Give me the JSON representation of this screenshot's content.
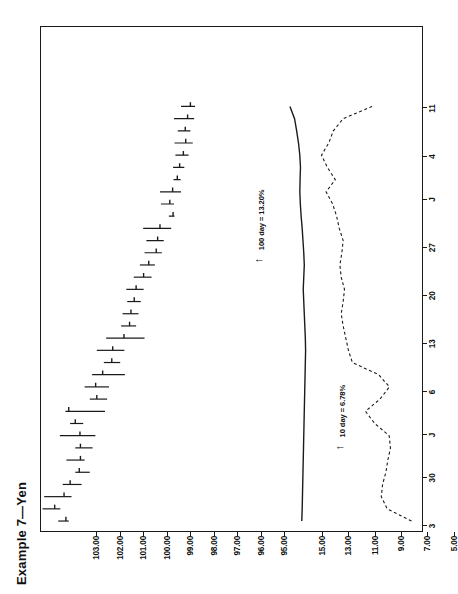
{
  "figure": {
    "title": "Example 7—Yen",
    "frame_color": "#1a1a1a"
  },
  "annotations": [
    {
      "name": "annotation-100day",
      "text": "100 day = 13.20%",
      "x": 0.555,
      "y": 0.565
    },
    {
      "name": "annotation-10day",
      "text": "10 day = 6.78%",
      "x": 0.185,
      "y": 0.775
    }
  ],
  "chart_data": {
    "type": "bar",
    "title": "Example 7—Yen",
    "xlabel": "",
    "ylabel": "",
    "grid": false,
    "legend": "none",
    "orientation": "rotated-90-ccw",
    "price_axis": {
      "name": "price-axis",
      "ticks": [
        "103.00",
        "102.00",
        "101.00",
        "100.00",
        "99.00",
        "98.00",
        "97.00",
        "96.00",
        "95.00"
      ],
      "values": [
        103.0,
        102.0,
        101.0,
        100.0,
        99.0,
        98.0,
        97.0,
        96.0,
        95.0
      ],
      "range": [
        94.4,
        103.6
      ]
    },
    "volatility_axis": {
      "name": "volatility-axis",
      "ticks": [
        "15.00",
        "13.00",
        "11.00",
        "9.00",
        "7.00",
        "5.00"
      ],
      "values": [
        15.0,
        13.0,
        11.0,
        9.0,
        7.0,
        5.0
      ],
      "range": [
        4.3,
        15.9
      ]
    },
    "date_axis": {
      "name": "date-axis",
      "ticks": [
        "3",
        "30",
        "J",
        "6",
        "13",
        "20",
        "27",
        "J",
        "4",
        "11"
      ],
      "positions": [
        0.012,
        0.107,
        0.192,
        0.277,
        0.372,
        0.467,
        0.562,
        0.657,
        0.742,
        0.837
      ]
    },
    "series": [
      {
        "name": "price-bars",
        "label": "Daily high/low/close bars",
        "style": "hlc-bar",
        "points": [
          {
            "i": 0,
            "high": 102.95,
            "low": 102.5,
            "close": 102.62
          },
          {
            "i": 1,
            "high": 103.62,
            "low": 102.86,
            "close": 103.1
          },
          {
            "i": 2,
            "high": 103.55,
            "low": 102.38,
            "close": 102.7
          },
          {
            "i": 3,
            "high": 102.76,
            "low": 101.95,
            "close": 102.44
          },
          {
            "i": 4,
            "high": 102.22,
            "low": 101.6,
            "close": 102.05
          },
          {
            "i": 5,
            "high": 102.6,
            "low": 101.82,
            "close": 102.0
          },
          {
            "i": 6,
            "high": 102.22,
            "low": 101.48,
            "close": 102.0
          },
          {
            "i": 7,
            "high": 102.88,
            "low": 101.36,
            "close": 102.02
          },
          {
            "i": 8,
            "high": 102.44,
            "low": 101.88,
            "close": 102.22
          },
          {
            "i": 9,
            "high": 102.64,
            "low": 100.95,
            "close": 102.5
          },
          {
            "i": 10,
            "high": 101.6,
            "low": 100.86,
            "close": 101.3
          },
          {
            "i": 11,
            "high": 101.82,
            "low": 100.78,
            "close": 101.35
          },
          {
            "i": 12,
            "high": 101.5,
            "low": 100.1,
            "close": 101.05
          },
          {
            "i": 13,
            "high": 101.0,
            "low": 100.3,
            "close": 100.66
          },
          {
            "i": 14,
            "high": 101.3,
            "low": 100.12,
            "close": 100.62
          },
          {
            "i": 15,
            "high": 100.9,
            "low": 99.26,
            "close": 100.14
          },
          {
            "i": 16,
            "high": 100.26,
            "low": 99.62,
            "close": 99.9
          },
          {
            "i": 17,
            "high": 100.2,
            "low": 99.52,
            "close": 99.84
          },
          {
            "i": 18,
            "high": 100.0,
            "low": 99.42,
            "close": 99.7
          },
          {
            "i": 19,
            "high": 100.04,
            "low": 99.3,
            "close": 99.62
          },
          {
            "i": 20,
            "high": 99.72,
            "low": 98.96,
            "close": 99.3
          },
          {
            "i": 21,
            "high": 99.46,
            "low": 98.82,
            "close": 99.08
          },
          {
            "i": 22,
            "high": 99.26,
            "low": 98.52,
            "close": 98.76
          },
          {
            "i": 23,
            "high": 99.18,
            "low": 98.44,
            "close": 98.7
          },
          {
            "i": 24,
            "high": 99.32,
            "low": 98.12,
            "close": 98.6
          },
          {
            "i": 25,
            "high": 98.22,
            "low": 97.98,
            "close": 98.04
          },
          {
            "i": 26,
            "high": 98.56,
            "low": 98.0,
            "close": 98.18
          },
          {
            "i": 27,
            "high": 98.6,
            "low": 97.7,
            "close": 98.06
          },
          {
            "i": 28,
            "high": 98.02,
            "low": 97.72,
            "close": 97.86
          },
          {
            "i": 29,
            "high": 98.04,
            "low": 97.56,
            "close": 97.76
          },
          {
            "i": 30,
            "high": 97.94,
            "low": 97.38,
            "close": 97.6
          },
          {
            "i": 31,
            "high": 97.98,
            "low": 97.2,
            "close": 97.5
          },
          {
            "i": 32,
            "high": 97.84,
            "low": 97.3,
            "close": 97.52
          },
          {
            "i": 33,
            "high": 98.0,
            "low": 97.14,
            "close": 97.42
          },
          {
            "i": 34,
            "high": 97.7,
            "low": 97.1,
            "close": 97.3
          }
        ]
      },
      {
        "name": "volatility-100day",
        "label": "100 day volatility",
        "style": "solid-line",
        "values": [
          13.45,
          13.42,
          13.4,
          13.38,
          13.36,
          13.34,
          13.32,
          13.3,
          13.28,
          13.26,
          13.24,
          13.22,
          13.2,
          13.18,
          13.16,
          13.18,
          13.22,
          13.26,
          13.3,
          13.34,
          13.3,
          13.26,
          13.3,
          13.36,
          13.42,
          13.5,
          13.56,
          13.6,
          13.58,
          13.55,
          13.6,
          13.7,
          13.84,
          14.0,
          14.35
        ]
      },
      {
        "name": "volatility-10day",
        "label": "10 day volatility",
        "style": "dashed-line",
        "values": [
          5.1,
          6.95,
          7.4,
          7.3,
          7.05,
          6.9,
          6.7,
          6.8,
          7.9,
          8.6,
          7.5,
          6.78,
          7.6,
          9.6,
          9.9,
          10.1,
          10.3,
          10.45,
          10.3,
          10.2,
          10.45,
          10.55,
          10.4,
          10.3,
          10.6,
          10.8,
          11.1,
          11.6,
          10.9,
          11.5,
          11.95,
          11.4,
          11.05,
          10.3,
          8.1
        ]
      }
    ]
  }
}
